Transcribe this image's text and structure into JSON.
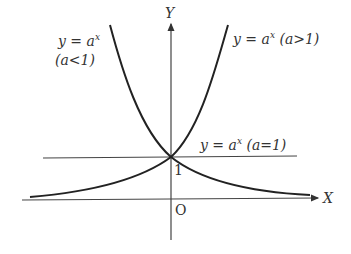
{
  "diagram": {
    "axis_x_label": "X",
    "axis_y_label": "Y",
    "origin_label": "O",
    "intercept_label": "1",
    "curve_decreasing": {
      "eq": "y = a",
      "exp": "x",
      "cond": "(a<1)"
    },
    "curve_increasing": {
      "eq": "y = a",
      "exp": "x",
      "cond": "(a>1)"
    },
    "line_constant": {
      "eq": "y = a",
      "exp": "x",
      "cond": "(a=1)"
    },
    "colors": {
      "stroke": "#222222",
      "text": "#333333"
    }
  }
}
